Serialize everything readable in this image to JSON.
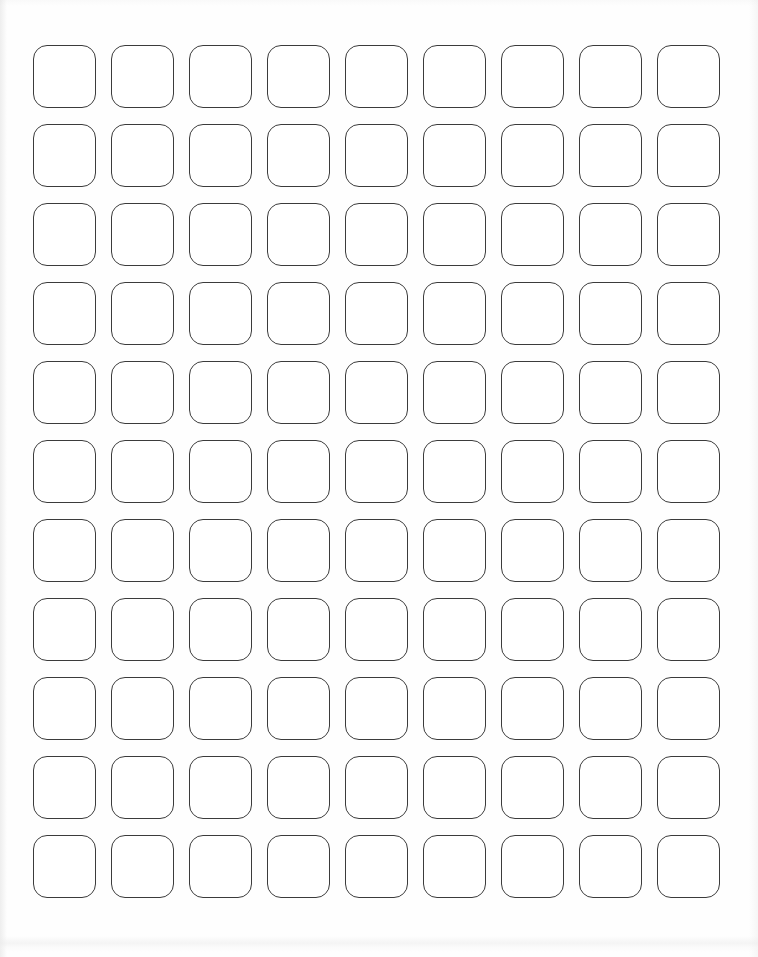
{
  "document": {
    "kind": "blank-label-sheet",
    "title": "Blank Rounded Square Label Sheet",
    "page_width_px": 758,
    "page_height_px": 957,
    "background_color": "#fefefe"
  },
  "grid": {
    "rows": 11,
    "columns": 9,
    "total_cells": 99,
    "origin_x_px": 33,
    "origin_y_px": 45,
    "cell_width_px": 63,
    "cell_height_px": 63,
    "column_pitch_px": 78,
    "row_pitch_px": 79,
    "column_gap_px": 15,
    "row_gap_px": 16,
    "corner_radius_px": 14,
    "outline_color": "#3b3b3b",
    "outline_width_px": 1.2,
    "fill_color": "#ffffff",
    "cell_content": ""
  },
  "margins": {
    "left_px": 33,
    "top_px": 45,
    "right_px": 38,
    "bottom_px": 39
  }
}
